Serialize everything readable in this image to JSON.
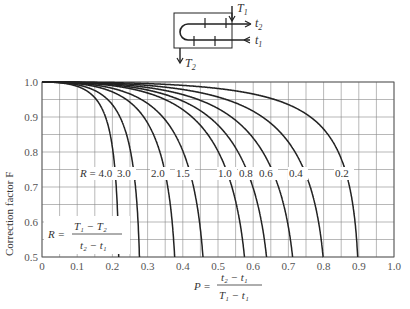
{
  "chart_data": {
    "type": "line",
    "title": "",
    "xlabel": "P = (t2 - t1) / (T1 - t1)",
    "ylabel": "Correction factor F",
    "xlim": [
      0,
      1.0
    ],
    "ylim": [
      0.5,
      1.0
    ],
    "x_ticks": [
      "0",
      "0.1",
      "0.2",
      "0.3",
      "0.4",
      "0.5",
      "0.6",
      "0.7",
      "0.8",
      "0.9",
      "1.0"
    ],
    "y_ticks": [
      "0.5",
      "0.6",
      "0.7",
      "0.8",
      "0.9",
      "1.0"
    ],
    "grid": true,
    "grid_step_x": 0.05,
    "grid_step_y": 0.05,
    "legend": "inline curve labels",
    "annotation": "R = (T1 - T2) / (t2 - t1)",
    "series": [
      {
        "name": "R = 4.0",
        "R": 4.0,
        "label": "R = 4.0",
        "P_at_F_0_5": 0.22
      },
      {
        "name": "3.0",
        "R": 3.0,
        "label": "3.0",
        "P_at_F_0_5": 0.28
      },
      {
        "name": "2.0",
        "R": 2.0,
        "label": "2.0",
        "P_at_F_0_5": 0.37
      },
      {
        "name": "1.5",
        "R": 1.5,
        "label": "1.5",
        "P_at_F_0_5": 0.45
      },
      {
        "name": "1.0",
        "R": 1.0,
        "label": "1.0",
        "P_at_F_0_5": 0.58
      },
      {
        "name": "0.8",
        "R": 0.8,
        "label": "0.8",
        "P_at_F_0_5": 0.635
      },
      {
        "name": "0.6",
        "R": 0.6,
        "label": "0.6",
        "P_at_F_0_5": 0.71
      },
      {
        "name": "0.4",
        "R": 0.4,
        "label": "0.4",
        "P_at_F_0_5": 0.8
      },
      {
        "name": "0.2",
        "R": 0.2,
        "label": "0.2",
        "P_at_F_0_5": 0.895
      }
    ]
  },
  "diagram": {
    "labels": {
      "T1": "T",
      "T1_sub": "1",
      "T2": "T",
      "T2_sub": "2",
      "t1": "t",
      "t1_sub": "1",
      "t2": "t",
      "t2_sub": "2"
    }
  },
  "labels": {
    "ylabel": "Correction factor  F",
    "R_eq": "R =",
    "R_num": "T₁ − T₂",
    "R_den": "t₂ − t₁",
    "P_eq": "P =",
    "P_num": "t₂ − t₁",
    "P_den": "T₁ − t₁"
  },
  "style": {
    "curve_color": "#222222",
    "grid_color": "#888888"
  }
}
